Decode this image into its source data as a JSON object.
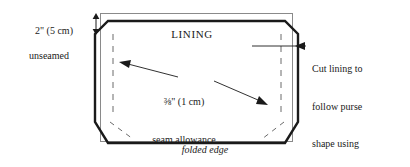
{
  "diagram": {
    "background_color": "#ffffff",
    "ink_color": "#1a1a1a",
    "thin_rect_color": "#8a8a8a",
    "labels": {
      "lining": "LINING",
      "folded_edge": "folded edge",
      "left_callout_line1": "2\" (5 cm)",
      "left_callout_line2": "unseamed",
      "seam_line1": "⅜\" (1 cm)",
      "seam_line2": "seam allowance",
      "right_callout_line1": "Cut lining to",
      "right_callout_line2": "follow purse",
      "right_callout_line3": "shape using",
      "right_callout_line4": "paper tracing"
    },
    "icons": {
      "up_down_arrow": "up-down-arrow-icon",
      "left_arrowhead": "left-arrow-icon",
      "down_right_arrowhead": "down-right-arrow-icon"
    }
  }
}
